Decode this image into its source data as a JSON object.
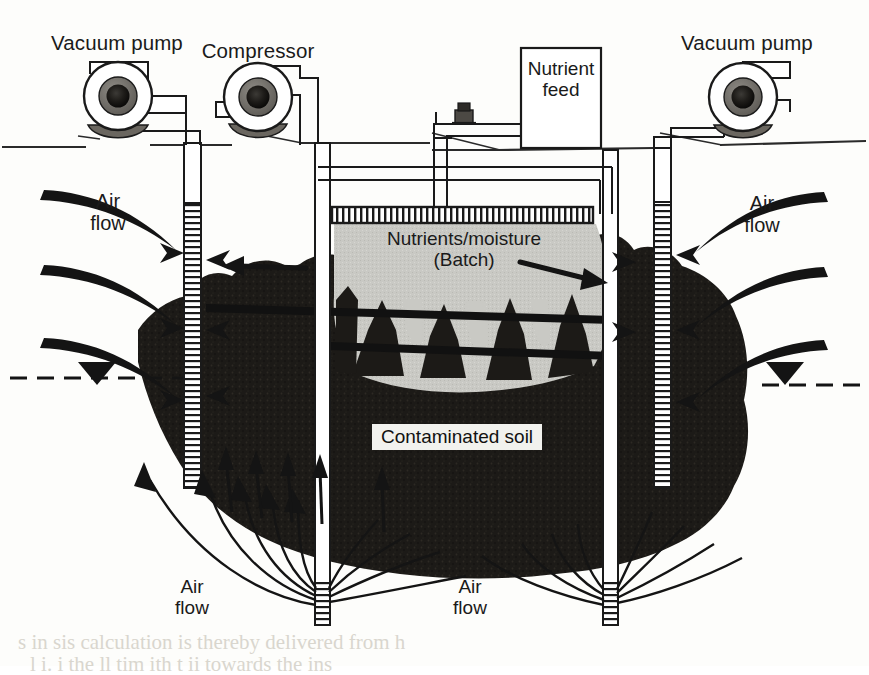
{
  "figure": {
    "background_color": "#fdfdfb",
    "ink_color": "#1a1a1a",
    "soil_color": "#1c1a17",
    "batch_zone_color": "#c9c9c4",
    "ghost_color": "#d9d6ce"
  },
  "equipment": {
    "vacuum_pump_left": "Vacuum pump",
    "compressor": "Compressor",
    "vacuum_pump_right": "Vacuum pump",
    "nutrient_feed": "Nutrient\nfeed"
  },
  "zones": {
    "batch_label": "Nutrients/moisture\n(Batch)",
    "soil_label": "Contaminated soil"
  },
  "flow_labels": {
    "air_flow_left": "Air\nflow",
    "air_flow_right": "Air\nflow",
    "air_flow_bottom_left": "Air\nflow",
    "air_flow_bottom_right": "Air\nflow"
  },
  "ghost_text": {
    "line1": "s in sis calculation is thereby delivered from h",
    "line2": "l  i.  i  the  ll  tim    ith  t  ii  towards  the  ins"
  }
}
